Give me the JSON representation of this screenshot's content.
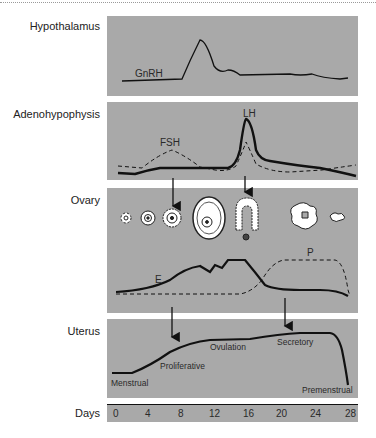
{
  "panels": {
    "hypothalamus": {
      "label": "Hypothalamus",
      "curve_label": "GnRH"
    },
    "adenohypophysis": {
      "label": "Adenohypophysis",
      "fsh_label": "FSH",
      "lh_label": "LH"
    },
    "ovary": {
      "label": "Ovary",
      "estrogen_label": "E",
      "progesterone_label": "P"
    },
    "uterus": {
      "label": "Uterus",
      "phases": [
        "Menstrual",
        "Proliferative",
        "Ovulation",
        "Secretory",
        "Premenstrual"
      ]
    }
  },
  "axis": {
    "label": "Days",
    "ticks": [
      "0",
      "4",
      "8",
      "12",
      "16",
      "20",
      "24",
      "28"
    ]
  },
  "colors": {
    "panel_bg": "#a9a9a9",
    "line": "#111111",
    "text": "#2a2a2a"
  }
}
